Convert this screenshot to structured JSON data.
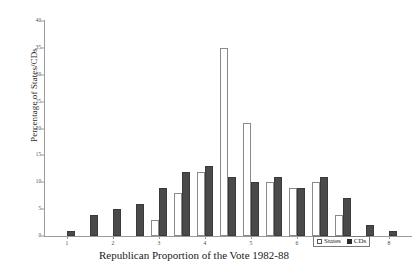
{
  "chart_data": {
    "type": "bar",
    "title": "",
    "xlabel": "Republican Proportion of the Vote 1982-88",
    "ylabel": "Percentage of States/CDs",
    "ylim": [
      0,
      40
    ],
    "yticks": [
      0,
      5,
      10,
      15,
      20,
      25,
      30,
      35,
      40
    ],
    "xticks": [
      1,
      2,
      3,
      4,
      5,
      6,
      7,
      8
    ],
    "xlim": [
      0.5,
      8.5
    ],
    "grid": false,
    "legend_position": "bottom-right",
    "categories": [
      "1",
      "1.5",
      "2",
      "2.5",
      "3",
      "3.5",
      "4",
      "4.5",
      "5",
      "5.5",
      "6",
      "6.5",
      "7",
      "7.5",
      "8"
    ],
    "series": [
      {
        "name": "States",
        "color": "#ffffff",
        "values": [
          0,
          0,
          0,
          0,
          3,
          8,
          12,
          35,
          21,
          10,
          9,
          10,
          4,
          0,
          0
        ]
      },
      {
        "name": "CDs",
        "color": "#2b2b2b",
        "values": [
          1,
          4,
          5,
          6,
          9,
          12,
          13,
          11,
          10,
          11,
          9,
          11,
          7,
          2,
          1
        ]
      }
    ],
    "legend": [
      {
        "label": "States",
        "swatch": "open-square"
      },
      {
        "label": "CDs",
        "swatch": "filled-square"
      }
    ]
  },
  "axis": {
    "y_title": "Percentage of States/CDs",
    "x_title": "Republican Proportion of the Vote 1982-88"
  }
}
